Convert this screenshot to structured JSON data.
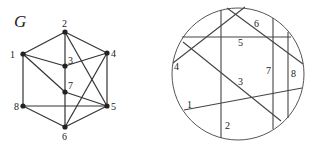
{
  "graph": {
    "title": "G",
    "nodes": [
      {
        "id": "1",
        "label": "1",
        "x": 23,
        "y": 54,
        "lx": 10,
        "ly": 58
      },
      {
        "id": "2",
        "label": "2",
        "x": 65,
        "y": 32,
        "lx": 62,
        "ly": 27
      },
      {
        "id": "3",
        "label": "3",
        "x": 65,
        "y": 66,
        "lx": 68,
        "ly": 64
      },
      {
        "id": "4",
        "label": "4",
        "x": 107,
        "y": 53,
        "lx": 111,
        "ly": 57
      },
      {
        "id": "5",
        "label": "5",
        "x": 107,
        "y": 106,
        "lx": 111,
        "ly": 110
      },
      {
        "id": "6",
        "label": "6",
        "x": 65,
        "y": 127,
        "lx": 62,
        "ly": 140
      },
      {
        "id": "7",
        "label": "7",
        "x": 65,
        "y": 92,
        "lx": 68,
        "ly": 89
      },
      {
        "id": "8",
        "label": "8",
        "x": 23,
        "y": 106,
        "lx": 14,
        "ly": 110
      }
    ],
    "edges": [
      [
        "1",
        "2"
      ],
      [
        "2",
        "4"
      ],
      [
        "1",
        "3"
      ],
      [
        "3",
        "4"
      ],
      [
        "1",
        "7"
      ],
      [
        "7",
        "5"
      ],
      [
        "1",
        "8"
      ],
      [
        "8",
        "5"
      ],
      [
        "8",
        "6"
      ],
      [
        "6",
        "5"
      ],
      [
        "2",
        "6"
      ],
      [
        "2",
        "5"
      ],
      [
        "4",
        "5"
      ],
      [
        "4",
        "6"
      ]
    ]
  },
  "circle_diagram": {
    "circle": {
      "cx": 238,
      "cy": 74,
      "r": 66
    },
    "chords": [
      {
        "label": "1",
        "x1": 184,
        "y1": 110,
        "x2": 302,
        "y2": 88,
        "lx": 187,
        "ly": 108
      },
      {
        "label": "2",
        "x1": 221,
        "y1": 10,
        "x2": 221,
        "y2": 138,
        "lx": 225,
        "ly": 129
      },
      {
        "label": "3",
        "x1": 183,
        "y1": 42,
        "x2": 281,
        "y2": 121,
        "lx": 238,
        "ly": 85
      },
      {
        "label": "4",
        "x1": 173,
        "y1": 63,
        "x2": 245,
        "y2": 7,
        "lx": 174,
        "ly": 70
      },
      {
        "label": "5",
        "x1": 182,
        "y1": 37,
        "x2": 291,
        "y2": 37,
        "lx": 238,
        "ly": 46
      },
      {
        "label": "6",
        "x1": 227,
        "y1": 8,
        "x2": 303,
        "y2": 64,
        "lx": 254,
        "ly": 27
      },
      {
        "label": "7",
        "x1": 273,
        "y1": 18,
        "x2": 273,
        "y2": 129,
        "lx": 266,
        "ly": 74
      },
      {
        "label": "8",
        "x1": 288,
        "y1": 32,
        "x2": 288,
        "y2": 118,
        "lx": 291,
        "ly": 77
      }
    ]
  }
}
